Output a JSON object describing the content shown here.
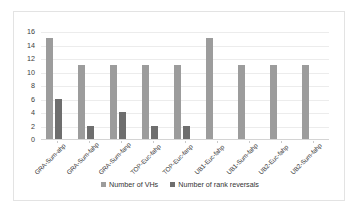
{
  "chart_data": {
    "type": "bar",
    "title": "",
    "xlabel": "",
    "ylabel": "",
    "ylim": [
      0,
      16
    ],
    "yticks": [
      16,
      14,
      12,
      10,
      8,
      6,
      4,
      2,
      0
    ],
    "grid": true,
    "legend_position": "bottom",
    "categories": [
      "GRA-Sum-ahp",
      "GRA-Sum-fahp",
      "GRA-Sum-fanp",
      "TOP-Euc-fahp",
      "TOP-Euc-fanp",
      "UB1-Euc-fahp",
      "UB1-Sum-fahp",
      "UB2-Euc-fahp",
      "UB2-Sum-fahp"
    ],
    "series": [
      {
        "name": "Number of VHs",
        "color": "#9c9c9c",
        "values": [
          15,
          11,
          11,
          11,
          11,
          15,
          11,
          11,
          11
        ]
      },
      {
        "name": "Number of rank reversals",
        "color": "#6e6e6e",
        "values": [
          6,
          2,
          4,
          2,
          2,
          0,
          0,
          0,
          0
        ]
      }
    ]
  },
  "legend": {
    "items": [
      {
        "label": "Number of VHs",
        "color": "#9c9c9c"
      },
      {
        "label": "Number of rank reversals",
        "color": "#6e6e6e"
      }
    ]
  }
}
